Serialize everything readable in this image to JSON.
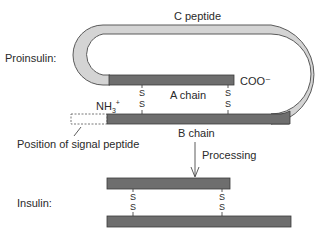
{
  "diagram": {
    "type": "biochemistry-schematic",
    "labels": {
      "c_peptide": "C peptide",
      "proinsulin": "Proinsulin:",
      "a_chain": "A chain",
      "b_chain": "B chain",
      "coo_terminus": "COO⁻",
      "nh3_base": "NH",
      "nh3_sub": "3",
      "nh3_sup": "+",
      "signal_peptide": "Position of signal peptide",
      "processing": "Processing",
      "insulin": "Insulin:"
    },
    "disulfide": {
      "top": "S",
      "bottom": "S"
    },
    "colors": {
      "chain_fill": "#6e6e6e",
      "chain_stroke": "#3a3a3a",
      "c_peptide_fill": "#d4d4d4",
      "c_peptide_stroke": "#5a5a5a",
      "text": "#2a2a2a"
    },
    "nodes": [
      {
        "id": "proinsulin-a-chain",
        "label": "A chain"
      },
      {
        "id": "proinsulin-b-chain",
        "label": "B chain"
      },
      {
        "id": "c-peptide-loop",
        "label": "C peptide"
      },
      {
        "id": "signal-peptide-position",
        "label": "Position of signal peptide"
      },
      {
        "id": "insulin-a-chain"
      },
      {
        "id": "insulin-b-chain"
      }
    ],
    "edges": [
      {
        "from": "proinsulin",
        "to": "insulin",
        "label": "Processing"
      },
      {
        "type": "disulfide",
        "between": [
          "proinsulin-a-chain",
          "proinsulin-b-chain"
        ],
        "count": 2
      },
      {
        "type": "disulfide",
        "between": [
          "insulin-a-chain",
          "insulin-b-chain"
        ],
        "count": 2
      }
    ]
  }
}
